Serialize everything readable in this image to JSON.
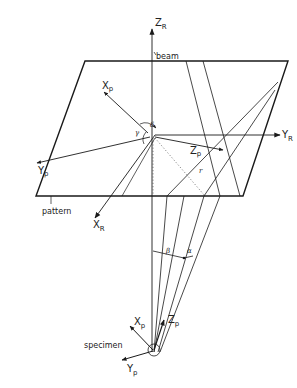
{
  "figure": {
    "type": "geometry-diagram",
    "colors": {
      "ink": "#1a1a1a",
      "background": "#ffffff"
    },
    "labels": {
      "z_r": {
        "main": "Z",
        "sub": "R"
      },
      "y_r": {
        "main": "Y",
        "sub": "R"
      },
      "x_r": {
        "main": "X",
        "sub": "R"
      },
      "x_p_prime": {
        "main": "X",
        "prime": "´",
        "sub": "p"
      },
      "y_p_prime": {
        "main": "Y",
        "prime": "´",
        "sub": "p"
      },
      "z_p_prime": {
        "main": "Z",
        "prime": "´",
        "sub": "p"
      },
      "x_p": {
        "main": "X",
        "sub": "p"
      },
      "y_p": {
        "main": "Y",
        "sub": "p"
      },
      "z_p": {
        "main": "Z",
        "sub": "p"
      },
      "beam": "beam",
      "pattern": "pattern",
      "specimen": "specimen",
      "gamma": "γ",
      "delta": "δ",
      "beta": "β",
      "alpha": "α",
      "r": "r"
    }
  }
}
